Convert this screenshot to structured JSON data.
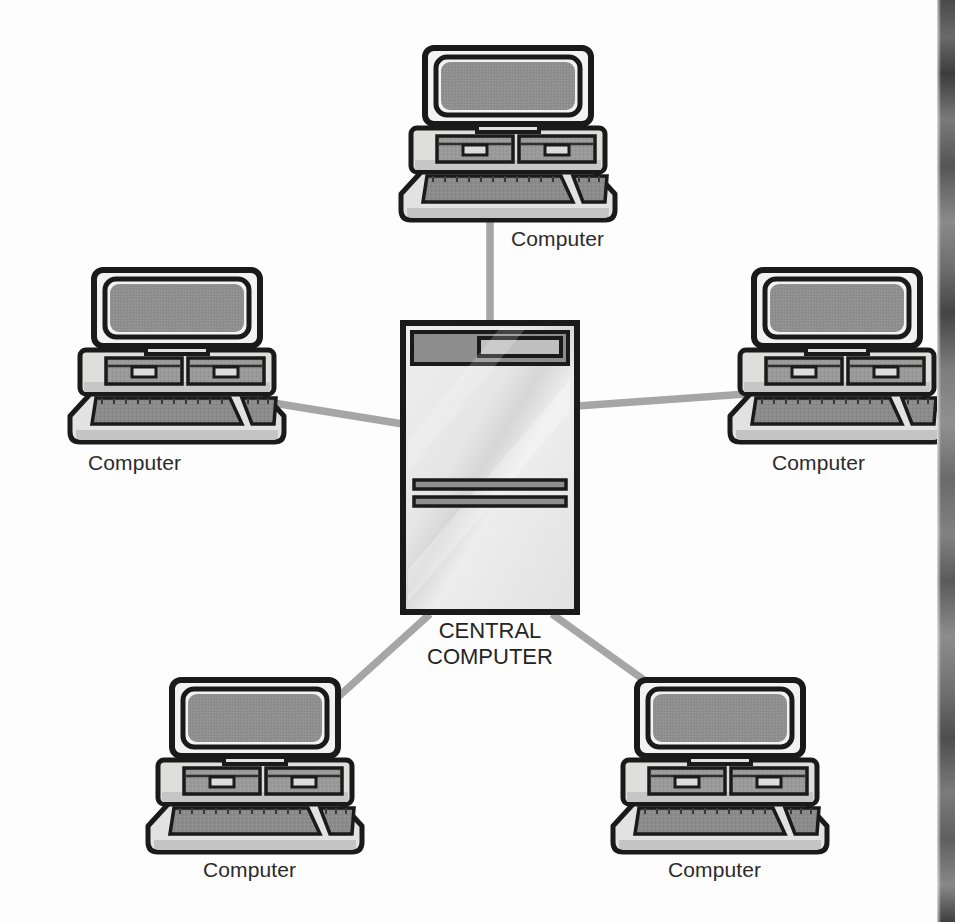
{
  "diagram": {
    "type": "network-topology",
    "central_node": {
      "label_line1": "CENTRAL",
      "label_line2": "COMPUTER",
      "icon": "mainframe-tower-icon"
    },
    "nodes": [
      {
        "id": "top",
        "label": "Computer",
        "icon": "desktop-computer-icon",
        "position": "top"
      },
      {
        "id": "left",
        "label": "Computer",
        "icon": "desktop-computer-icon",
        "position": "left"
      },
      {
        "id": "right",
        "label": "Computer",
        "icon": "desktop-computer-icon",
        "position": "right"
      },
      {
        "id": "bottom-left",
        "label": "Computer",
        "icon": "desktop-computer-icon",
        "position": "bottom-left"
      },
      {
        "id": "bottom-right",
        "label": "Computer",
        "icon": "desktop-computer-icon",
        "position": "bottom-right"
      }
    ],
    "connections": [
      {
        "from": "central",
        "to": "top"
      },
      {
        "from": "central",
        "to": "left"
      },
      {
        "from": "central",
        "to": "right"
      },
      {
        "from": "central",
        "to": "bottom-left"
      },
      {
        "from": "central",
        "to": "bottom-right"
      }
    ],
    "colors": {
      "outline": "#1a1a1a",
      "screen": "#8f8f8f",
      "case_light": "#e2e2e2",
      "case_mid": "#c9c9c9",
      "drive_gray": "#9a9a9a",
      "keyboard_gray": "#8b8b8b",
      "link_line": "#a6a6a6",
      "background": "#fdfdfd",
      "label_text": "#2b2b2b"
    }
  }
}
